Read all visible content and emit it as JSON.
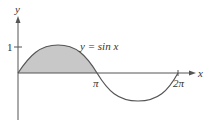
{
  "figure": {
    "function_label": "y = sin x",
    "x_axis_label": "x",
    "y_axis_label": "y",
    "y_tick_label": "1",
    "x_tick_labels": [
      "π",
      "2π"
    ],
    "shaded_region": "area under y = sin x from 0 to π",
    "colors": {
      "curve": "#555555",
      "axis": "#555555",
      "shade": "#c8c8c8"
    }
  }
}
